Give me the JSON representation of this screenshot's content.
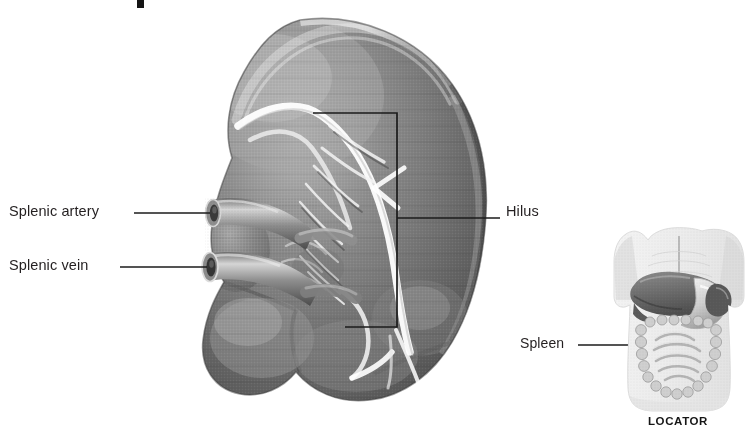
{
  "figure": {
    "style": "grayscale-halftone-medical-illustration",
    "background": "#ffffff"
  },
  "labels": {
    "splenic_artery": "Splenic artery",
    "splenic_vein": "Splenic vein",
    "hilus": "Hilus",
    "spleen": "Spleen",
    "locator": "LOCATOR"
  },
  "colors": {
    "text": "#231f20",
    "leader_line": "#1b1b1b",
    "organ_mid": "#7a7a7a",
    "organ_dark": "#4a4a4a",
    "organ_light": "#c9c9c9",
    "vessel_highlight": "#f2f2f2",
    "locator_body": "#e9e9e9",
    "locator_organ": "#8d8d8d"
  },
  "annotations": {
    "hilus_bracket": {
      "shape": "rectangle-open-left",
      "x_left": 313,
      "x_right": 397,
      "y_top": 113,
      "y_bottom": 327,
      "leader_y": 218,
      "leader_x_end": 500
    },
    "artery_leader": {
      "x_start": 134,
      "x_end": 210,
      "y": 213
    },
    "vein_leader": {
      "x_start": 120,
      "x_end": 208,
      "y": 267
    },
    "spleen_leader": {
      "x_start": 578,
      "x_end": 692,
      "y": 345,
      "riser_top": 308
    }
  },
  "locator": {
    "view": "anterior-abdomen-torso",
    "organs_shown": [
      "liver",
      "stomach",
      "small-intestine",
      "large-intestine",
      "spleen"
    ]
  }
}
